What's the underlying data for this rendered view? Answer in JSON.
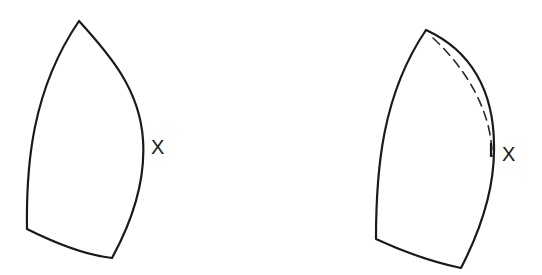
{
  "figures": [
    {
      "id": "left",
      "description": "curved sail-like shape with label at right-most point",
      "label": "X",
      "has_dashed_curve": false
    },
    {
      "id": "right",
      "description": "same shape with dashed inner curve indicating original edge",
      "label": "X",
      "has_dashed_curve": true
    }
  ],
  "colors": {
    "stroke": "#1a1a1a",
    "background": "#ffffff"
  }
}
